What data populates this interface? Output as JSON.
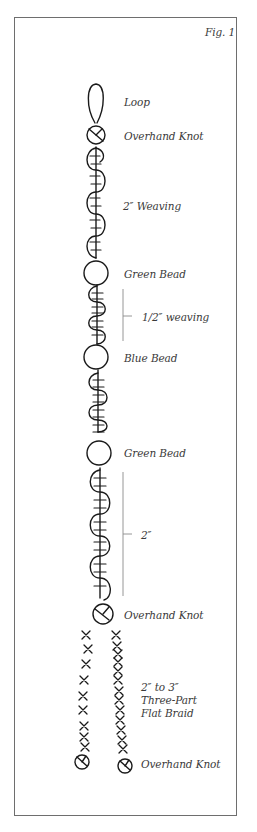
{
  "figure": {
    "title": "Fig. 1",
    "labels": {
      "loop": "Loop",
      "knot_top": "Overhand Knot",
      "weaving_1": "2″ Weaving",
      "bead_1": "Green Bead",
      "weaving_2": "1/2″ weaving",
      "bead_2": "Blue Bead",
      "bead_3": "Green Bead",
      "weaving_3": "2″",
      "knot_mid": "Overhand Knot",
      "braid_line1": "2″ to 3″",
      "braid_line2": "Three-Part",
      "braid_line3": "Flat Braid",
      "knot_bottom": "Overhand Knot"
    },
    "sequence": [
      "Loop",
      "Overhand Knot",
      "2\" Weaving",
      "Green Bead",
      "1/2\" weaving",
      "Blue Bead",
      "weaving",
      "Green Bead",
      "2\" weaving",
      "Overhand Knot",
      "2\" to 3\" Three-Part Flat Braid",
      "Overhand Knot"
    ],
    "colors": {
      "ink": "#1a1a1a",
      "label": "#3a3a3a",
      "bracket": "#8a8a8a",
      "border": "#6e6e6e"
    }
  }
}
